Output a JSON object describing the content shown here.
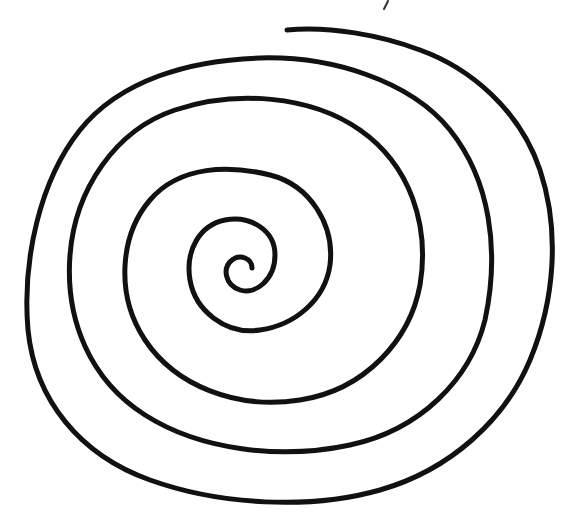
{
  "image": {
    "subject": "hand-drawn spiral",
    "stroke_color": "#111111",
    "background_color": "#ffffff",
    "turns": 4.5
  }
}
